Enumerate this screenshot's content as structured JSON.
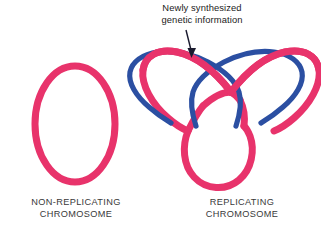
{
  "figure": {
    "background_color": "#ffffff"
  },
  "colors": {
    "parental_dna_pink": "#E8336B",
    "new_dna_blue": "#2B4FA2",
    "annotation_text": "#1b1b1b",
    "caption_text": "#3a3a3a",
    "arrow": "#1a1a2e"
  },
  "annotation": {
    "line1": "Newly synthesized",
    "line2": "genetic information",
    "points_to": "blue-strand"
  },
  "left_panel": {
    "caption_line1": "NON-REPLICATING",
    "caption_line2": "CHROMOSOME",
    "shape": "closed-circular-loop",
    "strand_color": "#E8336B"
  },
  "right_panel": {
    "caption_line1": "REPLICATING",
    "caption_line2": "CHROMOSOME",
    "shape": "theta-structure-three-lobes",
    "parental_strand_color": "#E8336B",
    "new_strand_color": "#2B4FA2",
    "lobes": [
      "left-upper-lobe",
      "right-upper-lobe",
      "lower-lobe"
    ],
    "replicated_lobes": [
      "left-upper-lobe",
      "right-upper-lobe"
    ],
    "unreplicated_lobes": [
      "lower-lobe"
    ]
  }
}
